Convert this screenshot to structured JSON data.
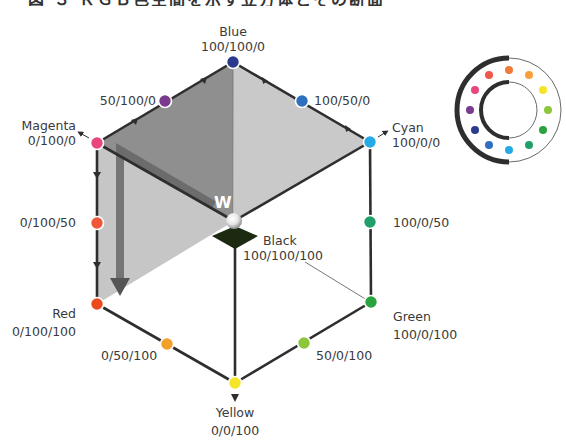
{
  "title": "図 ３ ＲＧＢ色空間を示す立方体とその断面",
  "center_label": "W",
  "vertices": [
    {
      "id": "blue",
      "name": "Blue",
      "value": "100/100/0",
      "color": "#2b3a8c",
      "x": 233,
      "y": 62
    },
    {
      "id": "mid-50-100-0",
      "name": "",
      "value": "50/100/0",
      "color": "#7b3a8e",
      "x": 165,
      "y": 101
    },
    {
      "id": "mid-100-50-0",
      "name": "",
      "value": "100/50/0",
      "color": "#2f6fbf",
      "x": 302,
      "y": 101
    },
    {
      "id": "magenta",
      "name": "Magenta",
      "value": "0/100/0",
      "color": "#e8467c",
      "x": 97,
      "y": 143
    },
    {
      "id": "cyan",
      "name": "Cyan",
      "value": "100/0/0",
      "color": "#27a9e6",
      "x": 370,
      "y": 142
    },
    {
      "id": "mid-0-100-50",
      "name": "",
      "value": "0/100/50",
      "color": "#f0573a",
      "x": 97,
      "y": 223
    },
    {
      "id": "mid-100-0-50",
      "name": "",
      "value": "100/0/50",
      "color": "#22a06b",
      "x": 370,
      "y": 222
    },
    {
      "id": "red",
      "name": "Red",
      "value": "0/100/100",
      "color": "#ec4a1c",
      "x": 97,
      "y": 304
    },
    {
      "id": "green",
      "name": "Green",
      "value": "100/0/100",
      "color": "#2aa23e",
      "x": 371,
      "y": 302
    },
    {
      "id": "mid-0-50-100",
      "name": "",
      "value": "0/50/100",
      "color": "#f2a02a",
      "x": 167,
      "y": 344
    },
    {
      "id": "mid-50-0-100",
      "name": "",
      "value": "50/0/100",
      "color": "#8cc63a",
      "x": 304,
      "y": 343
    },
    {
      "id": "yellow",
      "name": "Yellow",
      "value": "0/0/100",
      "color": "#f5e52a",
      "x": 235,
      "y": 383
    },
    {
      "id": "black",
      "name": "Black",
      "value": "100/100/100",
      "color": "#1d2a12",
      "x": 235,
      "y": 238
    }
  ],
  "labels": {
    "blue": {
      "name": "Blue",
      "value": "100/100/0"
    },
    "mid_50_100_0": {
      "value": "50/100/0"
    },
    "mid_100_50_0": {
      "value": "100/50/0"
    },
    "magenta": {
      "name": "Magenta",
      "value": "0/100/0"
    },
    "cyan": {
      "name": "Cyan",
      "value": "100/0/0"
    },
    "mid_0_100_50": {
      "value": "0/100/50"
    },
    "mid_100_0_50": {
      "value": "100/0/50"
    },
    "red": {
      "name": "Red",
      "value": "0/100/100"
    },
    "green": {
      "name": "Green",
      "value": "100/0/100"
    },
    "mid_0_50_100": {
      "value": "0/50/100"
    },
    "mid_50_0_100": {
      "value": "50/0/100"
    },
    "yellow": {
      "name": "Yellow",
      "value": "0/0/100"
    },
    "black": {
      "name": "Black",
      "value": "100/100/100"
    }
  },
  "color_wheel": {
    "center": [
      509,
      110
    ],
    "dots": [
      "#f07a3a",
      "#f5a03a",
      "#f5e52a",
      "#8cc63a",
      "#2aa23e",
      "#22a06b",
      "#27a9e6",
      "#2f6fbf",
      "#2b3a8c",
      "#7b3a8e",
      "#e8467c",
      "#f0574a"
    ]
  },
  "colors": {
    "shade_dark": "#8f8f8f",
    "shade_mid": "#b4b4b4",
    "shade_light": "#cfcfcf",
    "edge": "#2e2e2e",
    "arrow": "#5e5e5e"
  }
}
